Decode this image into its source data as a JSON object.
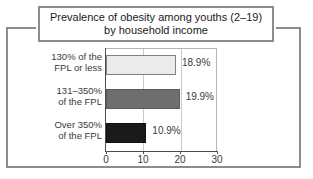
{
  "frame": {
    "border_color": "#8c8c8c"
  },
  "title": {
    "text": "Prevalence of obesity among youths (2–19)\nby household income"
  },
  "chart_data": {
    "type": "bar",
    "orientation": "horizontal",
    "title": "Prevalence of obesity among youths (2–19) by household income",
    "xlabel": "",
    "ylabel": "",
    "xlim": [
      0,
      30
    ],
    "xticks": [
      0,
      10,
      20,
      30
    ],
    "xtick_labels": [
      "0",
      "10",
      "20",
      "30"
    ],
    "grid": true,
    "legend": "none",
    "categories": [
      "130% of the\nFPL or less",
      "131–350%\nof the FPL",
      "Over 350%\nof the FPL"
    ],
    "values": [
      18.9,
      19.9,
      10.9
    ],
    "data_labels": [
      "18.9%",
      "19.9%",
      "10.9%"
    ],
    "bar_colors": [
      "#ebebeb",
      "#6e6e6e",
      "#1a1a1a"
    ]
  }
}
